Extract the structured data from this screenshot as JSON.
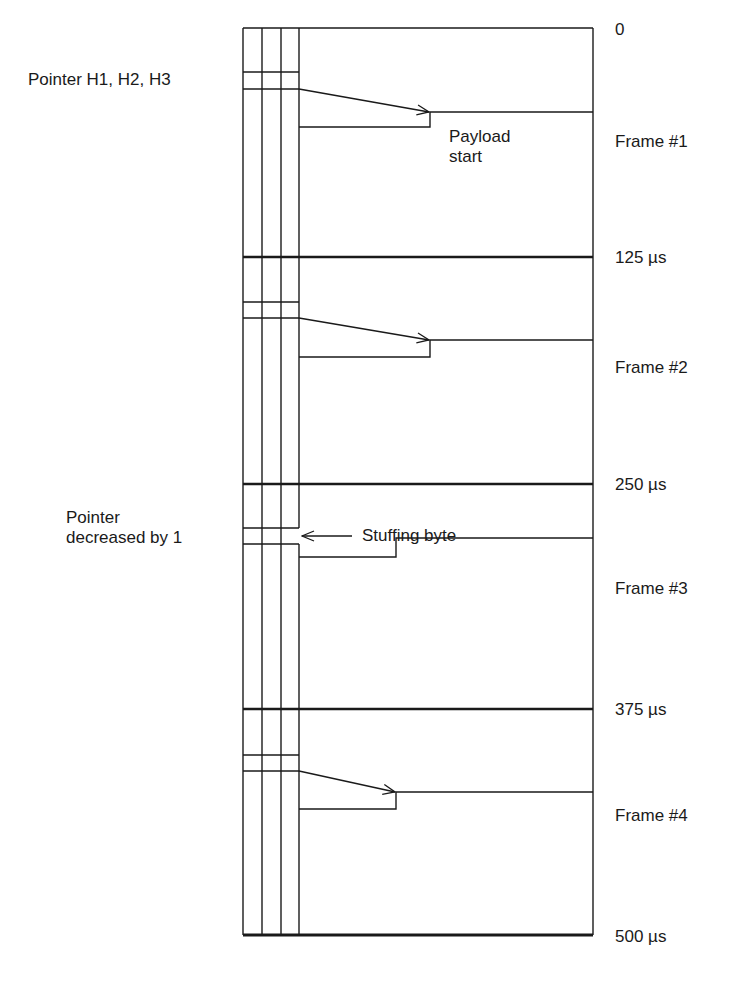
{
  "diagram": {
    "type": "SONET/SDH pointer justification (negative stuffing) frame diagram",
    "colors": {
      "line": "#1a1a1a",
      "background": "#ffffff"
    },
    "time_marks": [
      {
        "label": "0",
        "y": 28
      },
      {
        "label": "125 µs",
        "y": 257
      },
      {
        "label": "250 µs",
        "y": 484
      },
      {
        "label": "375 µs",
        "y": 709
      },
      {
        "label": "500 µs",
        "y": 935
      }
    ],
    "frames": [
      {
        "label": "Frame #1",
        "pointer_top": 72,
        "pointer_bottom": 89,
        "payload_y": 112,
        "step_x": 430,
        "lower_y": 127,
        "arrow": true
      },
      {
        "label": "Frame #2",
        "pointer_top": 302,
        "pointer_bottom": 318,
        "payload_y": 340,
        "step_x": 430,
        "lower_y": 357,
        "arrow": true
      },
      {
        "label": "Frame #3",
        "pointer_top": 528,
        "pointer_bottom": 544,
        "payload_y": 538,
        "step_x": 396,
        "lower_y": 557,
        "arrow": false
      },
      {
        "label": "Frame #4",
        "pointer_top": 755,
        "pointer_bottom": 771,
        "payload_y": 792,
        "step_x": 396,
        "lower_y": 809,
        "arrow": true
      }
    ],
    "annotations": {
      "pointer_h": "Pointer H1, H2, H3",
      "payload_start": "Payload\nstart",
      "pointer_decreased": "Pointer\ndecreased by 1",
      "stuffing_byte": "Stuffing byte"
    }
  }
}
